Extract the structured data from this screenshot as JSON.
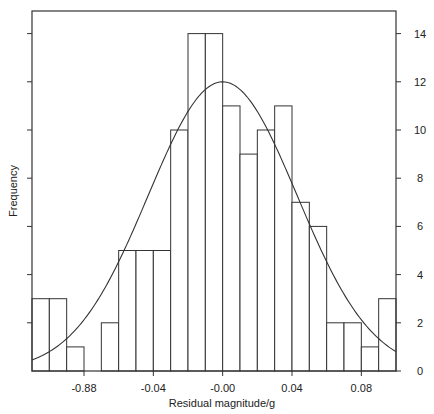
{
  "chart_data": {
    "type": "bar",
    "subtype": "histogram_with_normal_fit",
    "title": "",
    "xlabel": "Residual magnitude/g",
    "ylabel": "Frequency",
    "bin_width": 0.01,
    "bin_edges": [
      -0.11,
      -0.1,
      -0.09,
      -0.08,
      -0.07,
      -0.06,
      -0.05,
      -0.04,
      -0.03,
      -0.02,
      -0.01,
      0.0,
      0.01,
      0.02,
      0.03,
      0.04,
      0.05,
      0.06,
      0.07,
      0.08,
      0.09,
      0.1
    ],
    "values": [
      3,
      3,
      1,
      0,
      2,
      5,
      5,
      5,
      10,
      14,
      14,
      11,
      9,
      10,
      11,
      7,
      6,
      2,
      2,
      1,
      3
    ],
    "xlim": [
      -0.11,
      0.1
    ],
    "ylim": [
      0,
      15
    ],
    "x_ticks": [
      {
        "value": -0.08,
        "label": "-0.88"
      },
      {
        "value": -0.04,
        "label": "-0.04"
      },
      {
        "value": 0.0,
        "label": "-0.00"
      },
      {
        "value": 0.04,
        "label": "0.04"
      },
      {
        "value": 0.08,
        "label": "0.08"
      }
    ],
    "y_ticks": [
      0,
      2,
      4,
      6,
      8,
      10,
      12,
      14
    ],
    "y_tick_labels_side": "right",
    "grid": false,
    "legend": null,
    "fit_curve": {
      "type": "normal",
      "mean": 0.0,
      "sd": 0.043,
      "peak": 12
    },
    "colors": {
      "bar_fill": "#ffffff",
      "bar_stroke": "#333333",
      "curve": "#333333",
      "axis": "#333333"
    }
  }
}
